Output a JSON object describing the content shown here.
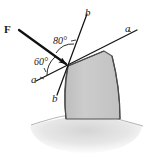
{
  "figure": {
    "kind": "engineering-mechanics-diagram",
    "force": {
      "label": "F",
      "name": "force-vector"
    },
    "angles": [
      {
        "id": "angle-80",
        "value": "80°",
        "between": "force-line and b-axis"
      },
      {
        "id": "angle-60",
        "value": "60°",
        "between": "force-line and a-axis"
      }
    ],
    "axes": [
      {
        "id": "axis-a",
        "label_upper": "a",
        "label_lower": "a"
      },
      {
        "id": "axis-b",
        "label_upper": "b",
        "label_lower": "b"
      }
    ],
    "colors": {
      "line": "#1a1a1a",
      "block_fill": "#c9c9c9",
      "block_stroke": "#4a4a4a",
      "ground_fill": "#dcdcdc",
      "background": "#ffffff"
    }
  }
}
